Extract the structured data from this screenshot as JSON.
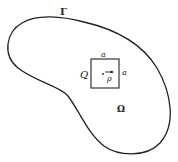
{
  "diagram": {
    "boundary_label": "Γ",
    "domain_label": "Ω",
    "square_label": "Q",
    "side_top_label": "a",
    "side_right_label": "a",
    "vector_label": "ρ",
    "stroke_color": "#222222",
    "background": "#ffffff"
  }
}
